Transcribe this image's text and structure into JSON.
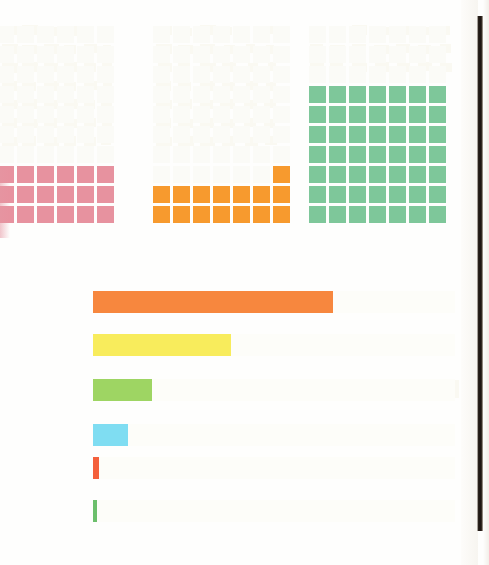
{
  "page": {
    "background": "#fefefd",
    "width": 489,
    "height": 565
  },
  "chart_data": [
    {
      "type": "waffle",
      "name": "pink-waffle",
      "title": "",
      "color": "#e7929f",
      "ghost_color": "#fbfbf7",
      "columns": 6,
      "rows_total": 10,
      "rows_filled": 3,
      "filled_squares": 18,
      "total_squares": 60,
      "value_pct": 30,
      "cell_px": 17,
      "gap_px": 3,
      "origin": {
        "x": -3,
        "y": 26
      }
    },
    {
      "type": "waffle",
      "name": "orange-waffle",
      "title": "",
      "color": "#f79a2e",
      "ghost_color": "#fbfbf7",
      "columns": 7,
      "rows_total": 10,
      "rows_filled": 2,
      "extra_squares": 1,
      "filled_squares": 15,
      "total_squares": 70,
      "value_pct": 21,
      "cell_px": 17,
      "gap_px": 3,
      "origin": {
        "x": 153,
        "y": 26
      }
    },
    {
      "type": "waffle",
      "name": "green-waffle",
      "title": "",
      "color": "#7ec79a",
      "ghost_color": "#fbfbf7",
      "columns": 7,
      "rows_total": 10,
      "rows_filled": 7,
      "filled_squares": 49,
      "total_squares": 70,
      "value_pct": 70,
      "cell_px": 17,
      "gap_px": 3,
      "origin": {
        "x": 309,
        "y": 26
      }
    },
    {
      "type": "bar",
      "name": "horizontal-bar-chart",
      "orientation": "horizontal",
      "title": "",
      "xlabel": "",
      "ylabel": "",
      "track_start_px": 93,
      "track_end_px": 455,
      "categories": [
        "bar-1",
        "bar-2",
        "bar-3",
        "bar-4",
        "bar-5",
        "bar-6"
      ],
      "values": [
        240,
        138,
        59,
        35,
        6,
        4
      ],
      "value_unit": "px",
      "colors": [
        "#f7873e",
        "#f8ec5c",
        "#9ed563",
        "#7fddf2",
        "#f4603c",
        "#6cbf6c"
      ],
      "ghost_color": "#fdfdf9",
      "bar_height_px": 22,
      "bar_tops_px": [
        291,
        334,
        379,
        424,
        457,
        500
      ]
    }
  ],
  "scan_artifacts": {
    "right_edge_label": "page-scan-dark-edge",
    "right_edge_color": "#1a1310",
    "right_edge_x": 477,
    "right_edge_width": 6,
    "right_edge_top": 16,
    "right_edge_bottom": 531,
    "bleed_through_label": "reverse-page-bleed-through",
    "bleed_through_color": "#faf9f2"
  }
}
